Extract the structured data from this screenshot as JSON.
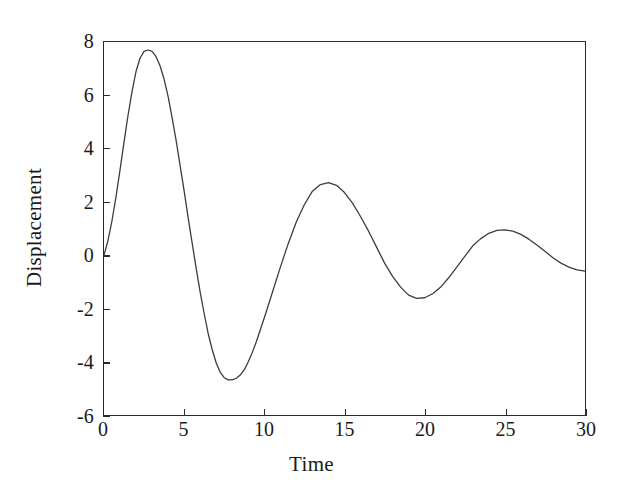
{
  "chart_data": {
    "type": "line",
    "title": "",
    "xlabel": "Time",
    "ylabel": "Displacement",
    "xlim": [
      0,
      30
    ],
    "ylim": [
      -6,
      8
    ],
    "xticks": [
      0,
      5,
      10,
      15,
      20,
      25,
      30
    ],
    "yticks": [
      -6,
      -4,
      -2,
      0,
      2,
      4,
      6,
      8
    ],
    "xtick_labels": [
      "0",
      "5",
      "10",
      "15",
      "20",
      "25",
      "30"
    ],
    "ytick_labels": [
      "-6",
      "-4",
      "-2",
      "0",
      "2",
      "4",
      "6",
      "8"
    ],
    "grid": false,
    "legend": null,
    "line_color": "#3c3c3c",
    "line_width": 1.3,
    "background_color": "#ffffff",
    "axis_color": "#2a2a2a",
    "series": [
      {
        "name": "Displacement",
        "description": "Damped oscillation: starts at 0, rises to peak 7.7 near t=3.1, decaying sinusoid with period about 11 time units",
        "x": [
          0.0,
          0.25,
          0.5,
          0.75,
          1.0,
          1.25,
          1.5,
          1.75,
          2.0,
          2.25,
          2.5,
          2.75,
          3.0,
          3.25,
          3.5,
          3.75,
          4.0,
          4.25,
          4.5,
          4.75,
          5.0,
          5.25,
          5.5,
          5.75,
          6.0,
          6.25,
          6.5,
          6.75,
          7.0,
          7.25,
          7.5,
          7.75,
          8.0,
          8.25,
          8.5,
          8.75,
          9.0,
          9.25,
          9.5,
          9.75,
          10.0,
          10.5,
          11.0,
          11.5,
          12.0,
          12.5,
          13.0,
          13.5,
          14.0,
          14.5,
          15.0,
          15.5,
          16.0,
          16.5,
          17.0,
          17.5,
          18.0,
          18.5,
          19.0,
          19.5,
          20.0,
          20.5,
          21.0,
          21.5,
          22.0,
          22.5,
          23.0,
          23.5,
          24.0,
          24.5,
          25.0,
          25.5,
          26.0,
          26.5,
          27.0,
          27.5,
          28.0,
          28.5,
          29.0,
          29.5,
          30.0
        ],
        "y": [
          0.0,
          0.55,
          1.3,
          2.2,
          3.2,
          4.25,
          5.25,
          6.15,
          6.9,
          7.4,
          7.65,
          7.7,
          7.65,
          7.45,
          7.1,
          6.6,
          5.95,
          5.15,
          4.3,
          3.35,
          2.4,
          1.4,
          0.45,
          -0.5,
          -1.4,
          -2.2,
          -2.95,
          -3.55,
          -4.05,
          -4.4,
          -4.6,
          -4.68,
          -4.68,
          -4.62,
          -4.5,
          -4.3,
          -4.0,
          -3.65,
          -3.25,
          -2.8,
          -2.35,
          -1.4,
          -0.45,
          0.45,
          1.25,
          1.9,
          2.4,
          2.65,
          2.72,
          2.62,
          2.35,
          1.95,
          1.45,
          0.9,
          0.3,
          -0.3,
          -0.8,
          -1.2,
          -1.5,
          -1.62,
          -1.6,
          -1.45,
          -1.2,
          -0.85,
          -0.45,
          -0.05,
          0.35,
          0.62,
          0.82,
          0.93,
          0.95,
          0.9,
          0.78,
          0.6,
          0.38,
          0.15,
          -0.1,
          -0.3,
          -0.45,
          -0.55,
          -0.6
        ]
      }
    ]
  },
  "axes": {
    "y_label": "Displacement",
    "x_label": "Time"
  }
}
